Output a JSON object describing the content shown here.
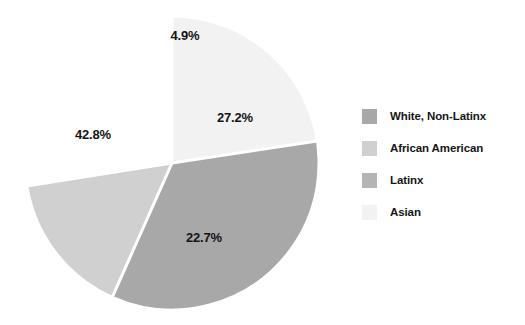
{
  "chart_data": {
    "type": "pie",
    "title": "",
    "subtitle": "",
    "xlabel": "",
    "ylabel": "",
    "grid": false,
    "legend_position": "right",
    "start_angle_deg": 0,
    "direction": "clockwise",
    "categories": [
      "White, Non-Latinx",
      "African American",
      "Latinx",
      "Asian"
    ],
    "values": [
      42.8,
      22.7,
      27.2,
      4.9
    ],
    "value_suffix": "%",
    "slices": [
      {
        "label": "White, Non-Latinx",
        "value": 42.8,
        "display": "42.8%",
        "color": "#a8a8a8",
        "draw_order": 3,
        "start_deg": 49.9,
        "end_deg": 204.0,
        "label_x": 93,
        "label_y": 134
      },
      {
        "label": "African American",
        "value": 22.7,
        "display": "22.7%",
        "color": "#d0d0d0",
        "draw_order": 2,
        "start_deg": 179.3,
        "end_deg": 261.0,
        "label_x": 204,
        "label_y": 237
      },
      {
        "label": "Latinx",
        "value": 27.2,
        "display": "27.2%",
        "color": "#b4b4b4",
        "draw_order": 1,
        "start_deg": 81.4,
        "end_deg": 179.3,
        "label_x": 235,
        "label_y": 117
      },
      {
        "label": "Asian",
        "value": 4.9,
        "display": "4.9%",
        "color": "#f2f2f2",
        "draw_order": 4,
        "start_deg": 0.0,
        "end_deg": 81.4,
        "label_x": 185,
        "label_y": 35
      }
    ],
    "geometry": {
      "center_x": 172,
      "center_y": 163,
      "radius": 147,
      "separator_color": "#ffffff",
      "separator_width": 3
    }
  },
  "legend": {
    "items": [
      {
        "label": "White, Non-Latinx",
        "color": "#a8a8a8"
      },
      {
        "label": "African American",
        "color": "#d0d0d0"
      },
      {
        "label": "Latinx",
        "color": "#b4b4b4"
      },
      {
        "label": "Asian",
        "color": "#f2f2f2"
      }
    ]
  }
}
